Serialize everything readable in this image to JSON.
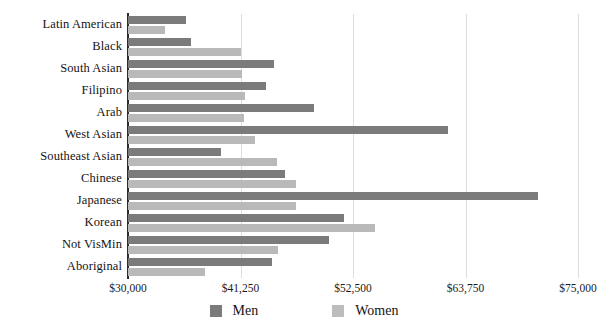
{
  "chart_data": {
    "type": "bar",
    "orientation": "horizontal",
    "title": "",
    "xlabel": "",
    "ylabel": "",
    "xlim": [
      30000,
      75000
    ],
    "xticks": [
      "$30,000",
      "$41,250",
      "$52,500",
      "$63,750",
      "$75,000"
    ],
    "xtick_values": [
      30000,
      41250,
      52500,
      63750,
      75000
    ],
    "grid": true,
    "legend_position": "bottom-center",
    "categories": [
      "Latin American",
      "Black",
      "South Asian",
      "Filipino",
      "Arab",
      "West Asian",
      "Southeast Asian",
      "Chinese",
      "Japanese",
      "Korean",
      "Not VisMin",
      "Aboriginal"
    ],
    "series": [
      {
        "name": "Men",
        "color": "#7b7b7b",
        "values": [
          35800,
          36300,
          44600,
          43800,
          48600,
          62000,
          39300,
          45700,
          71000,
          51600,
          50100,
          44400
        ]
      },
      {
        "name": "Women",
        "color": "#b9b9b9",
        "values": [
          33700,
          41300,
          41400,
          41700,
          41600,
          42700,
          44900,
          46800,
          46800,
          54700,
          45000,
          37700
        ]
      }
    ]
  },
  "legend": {
    "items": [
      {
        "label": "Men",
        "key": "men"
      },
      {
        "label": "Women",
        "key": "women"
      }
    ]
  }
}
